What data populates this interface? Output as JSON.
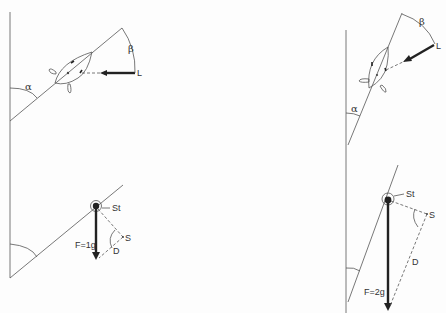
{
  "figure": {
    "colors": {
      "line": "#555555",
      "arrow": "#222222",
      "background": "#fdfdfd"
    },
    "left": {
      "top": {
        "angle_alpha_label": "α",
        "angle_beta_label": "β",
        "light_label": "L"
      },
      "bottom": {
        "statolith_label": "St",
        "force_label": "F=1g",
        "shear_label": "S",
        "deflection_label": "D"
      }
    },
    "right": {
      "top": {
        "angle_alpha_label": "α",
        "angle_beta_label": "β",
        "light_label": "L"
      },
      "bottom": {
        "statolith_label": "St",
        "force_label": "F=2g",
        "shear_label": "S",
        "deflection_label": "D"
      }
    }
  }
}
